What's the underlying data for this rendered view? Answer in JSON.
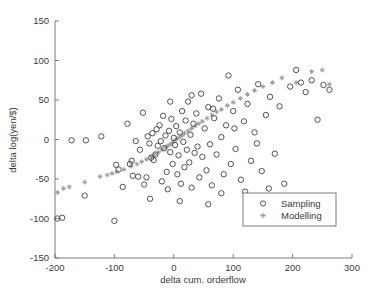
{
  "chart_data": {
    "type": "scatter",
    "title": "",
    "xlabel": "delta cum. orderflow",
    "ylabel": "delta log(yen/$)",
    "xlim": [
      -200,
      300
    ],
    "ylim": [
      -150,
      150
    ],
    "xticks": [
      -200,
      -100,
      0,
      100,
      200,
      300
    ],
    "yticks": [
      -150,
      -100,
      -50,
      0,
      50,
      100,
      150
    ],
    "xtick_labels": [
      "-200",
      "-100",
      "0",
      "100",
      "200",
      "300"
    ],
    "ytick_labels": [
      "-150",
      "-100",
      "-50",
      "0",
      "50",
      "100",
      "150"
    ],
    "grid": false,
    "legend_position": "lower right",
    "series": [
      {
        "name": "Sampling",
        "marker": "circle",
        "color": "#4a4a4a",
        "points": [
          [
            -196,
            -100
          ],
          [
            -188,
            -99
          ],
          [
            -172,
            -1
          ],
          [
            -150,
            -71
          ],
          [
            -148,
            -1
          ],
          [
            -100,
            -103
          ],
          [
            -97,
            -32
          ],
          [
            -93,
            -38
          ],
          [
            -78,
            20
          ],
          [
            -74,
            -31
          ],
          [
            -71,
            -27
          ],
          [
            -69,
            -46
          ],
          [
            -64,
            -2
          ],
          [
            -60,
            -47
          ],
          [
            -57,
            -13
          ],
          [
            -52,
            34
          ],
          [
            -50,
            -57
          ],
          [
            -46,
            -48
          ],
          [
            -44,
            4
          ],
          [
            -41,
            -5
          ],
          [
            -38,
            -23
          ],
          [
            -36,
            8
          ],
          [
            -34,
            -26
          ],
          [
            -31,
            -19
          ],
          [
            -29,
            13
          ],
          [
            -27,
            -8
          ],
          [
            -24,
            18
          ],
          [
            -22,
            -2
          ],
          [
            -20,
            -53
          ],
          [
            -18,
            30
          ],
          [
            -16,
            -11
          ],
          [
            -14,
            5
          ],
          [
            -12,
            -41
          ],
          [
            -10,
            -63
          ],
          [
            -8,
            11
          ],
          [
            -6,
            -16
          ],
          [
            -4,
            26
          ],
          [
            -2,
            -31
          ],
          [
            0,
            2
          ],
          [
            2,
            -7
          ],
          [
            4,
            17
          ],
          [
            6,
            -44
          ],
          [
            8,
            -20
          ],
          [
            10,
            9
          ],
          [
            12,
            -56
          ],
          [
            14,
            36
          ],
          [
            16,
            -3
          ],
          [
            18,
            -35
          ],
          [
            20,
            24
          ],
          [
            22,
            -13
          ],
          [
            24,
            48
          ],
          [
            26,
            -29
          ],
          [
            28,
            6
          ],
          [
            30,
            -61
          ],
          [
            33,
            20
          ],
          [
            35,
            -17
          ],
          [
            38,
            33
          ],
          [
            40,
            -9
          ],
          [
            43,
            -48
          ],
          [
            46,
            58
          ],
          [
            48,
            -22
          ],
          [
            52,
            14
          ],
          [
            55,
            -39
          ],
          [
            58,
            41
          ],
          [
            61,
            -6
          ],
          [
            64,
            -58
          ],
          [
            68,
            27
          ],
          [
            72,
            -19
          ],
          [
            76,
            52
          ],
          [
            80,
            3
          ],
          [
            84,
            -44
          ],
          [
            88,
            18
          ],
          [
            92,
            81
          ],
          [
            96,
            -31
          ],
          [
            100,
            36
          ],
          [
            104,
            -12
          ],
          [
            108,
            63
          ],
          [
            113,
            -51
          ],
          [
            118,
            23
          ],
          [
            124,
            45
          ],
          [
            130,
            -27
          ],
          [
            136,
            9
          ],
          [
            142,
            70
          ],
          [
            148,
            -40
          ],
          [
            155,
            31
          ],
          [
            162,
            54
          ],
          [
            170,
            -18
          ],
          [
            178,
            42
          ],
          [
            186,
            -56
          ],
          [
            196,
            67
          ],
          [
            206,
            88
          ],
          [
            214,
            72
          ],
          [
            222,
            60
          ],
          [
            232,
            75
          ],
          [
            242,
            25
          ],
          [
            252,
            69
          ],
          [
            262,
            63
          ],
          [
            80,
            -68
          ],
          [
            120,
            -66
          ],
          [
            160,
            -62
          ],
          [
            -122,
            4
          ],
          [
            -86,
            -60
          ],
          [
            -40,
            -75
          ],
          [
            10,
            -78
          ],
          [
            58,
            -82
          ],
          [
            -6,
            48
          ],
          [
            30,
            56
          ],
          [
            66,
            39
          ],
          [
            102,
            14
          ],
          [
            140,
            -5
          ]
        ]
      },
      {
        "name": "Modelling",
        "marker": "asterisk",
        "color": "#9a9a9a",
        "points": [
          [
            -196,
            -67
          ],
          [
            -186,
            -62
          ],
          [
            -176,
            -60
          ],
          [
            -150,
            -54
          ],
          [
            -124,
            -47
          ],
          [
            -112,
            -45
          ],
          [
            -104,
            -43
          ],
          [
            -96,
            -41
          ],
          [
            -84,
            -38
          ],
          [
            -72,
            -34
          ],
          [
            -62,
            -31
          ],
          [
            -54,
            -28
          ],
          [
            -46,
            -25
          ],
          [
            -38,
            -22
          ],
          [
            -32,
            -19
          ],
          [
            -26,
            -16
          ],
          [
            -20,
            -13
          ],
          [
            -14,
            -10
          ],
          [
            -10,
            -8
          ],
          [
            -6,
            -6
          ],
          [
            -2,
            -4
          ],
          [
            2,
            -1
          ],
          [
            6,
            1
          ],
          [
            10,
            3
          ],
          [
            14,
            5
          ],
          [
            18,
            8
          ],
          [
            24,
            11
          ],
          [
            30,
            14
          ],
          [
            36,
            17
          ],
          [
            42,
            20
          ],
          [
            48,
            23
          ],
          [
            56,
            27
          ],
          [
            64,
            31
          ],
          [
            72,
            35
          ],
          [
            80,
            38
          ],
          [
            90,
            43
          ],
          [
            100,
            47
          ],
          [
            112,
            52
          ],
          [
            124,
            57
          ],
          [
            136,
            62
          ],
          [
            150,
            67
          ],
          [
            166,
            72
          ],
          [
            182,
            78
          ],
          [
            206,
            72
          ],
          [
            232,
            86
          ],
          [
            250,
            88
          ],
          [
            262,
            70
          ]
        ]
      }
    ]
  },
  "legend": {
    "entries": [
      {
        "label": "Sampling",
        "marker": "circle"
      },
      {
        "label": "Modelling",
        "marker": "asterisk"
      }
    ]
  }
}
